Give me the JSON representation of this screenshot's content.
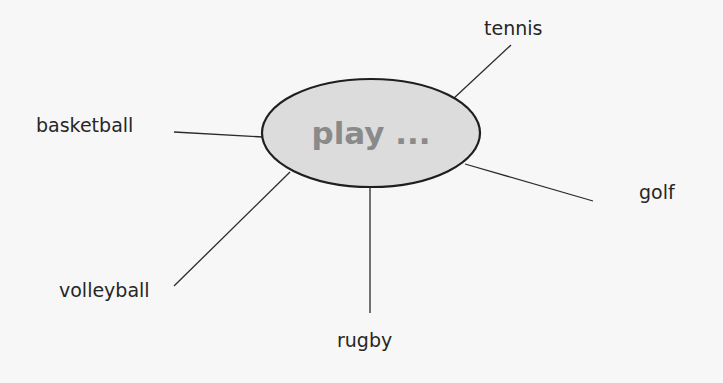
{
  "diagram": {
    "type": "spider-diagram",
    "background_color": "#f7f7f7",
    "line_color": "#2b2b2b",
    "hub": {
      "label": "play ...",
      "cx": 371,
      "cy": 133,
      "rx": 109,
      "ry": 54,
      "fill_color": "#dcdcdc",
      "border_color": "#1f1f1f",
      "text_color": "#8a8a8a"
    },
    "spokes": [
      {
        "label": "tennis",
        "line": {
          "x1": 453,
          "y1": 99,
          "x2": 511,
          "y2": 45
        },
        "label_pos": {
          "x": 484,
          "y": 19
        }
      },
      {
        "label": "basketball",
        "line": {
          "x1": 263,
          "y1": 137,
          "x2": 174,
          "y2": 132
        },
        "label_pos": {
          "x": 36,
          "y": 116
        }
      },
      {
        "label": "golf",
        "line": {
          "x1": 465,
          "y1": 164,
          "x2": 593,
          "y2": 201
        },
        "label_pos": {
          "x": 639,
          "y": 183
        }
      },
      {
        "label": "volleyball",
        "line": {
          "x1": 290,
          "y1": 172,
          "x2": 174,
          "y2": 286
        },
        "label_pos": {
          "x": 59,
          "y": 281
        }
      },
      {
        "label": "rugby",
        "line": {
          "x1": 370,
          "y1": 187,
          "x2": 370,
          "y2": 313
        },
        "label_pos": {
          "x": 337,
          "y": 331
        }
      }
    ]
  }
}
